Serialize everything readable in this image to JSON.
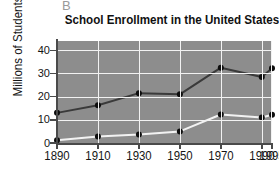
{
  "panel": {
    "letter": "B"
  },
  "title": "School Enrollment in the United States",
  "axes": {
    "ylabel": "Millions of Students",
    "xlabel": "",
    "yticks": [
      "0",
      "10",
      "20",
      "30",
      "40"
    ],
    "xticks": [
      "1890",
      "1910",
      "1930",
      "1950",
      "1970",
      "1990",
      "1995"
    ]
  },
  "colors": {
    "plot_background": "#8d8d8d",
    "gridline": "#f2f2f2",
    "axis": "#4a4a4a",
    "series_dark": "#3a3a3a",
    "series_light": "#f2f2f2",
    "marker": "#0d0d0d",
    "title_text": "#111111",
    "panel_letter": "#9a9a9a"
  },
  "chart_data": {
    "type": "line",
    "title": "School Enrollment in the United States",
    "xlabel": "",
    "ylabel": "Millions of Students",
    "x": [
      1890,
      1910,
      1930,
      1950,
      1970,
      1990,
      1995
    ],
    "categories": [
      "1890",
      "1910",
      "1930",
      "1950",
      "1970",
      "1990",
      "1995"
    ],
    "xlim": [
      1890,
      1995
    ],
    "ylim": [
      0,
      44
    ],
    "yticks": [
      0,
      10,
      20,
      30,
      40
    ],
    "grid": true,
    "legend": "none",
    "series": [
      {
        "name": "Elementary enrollment",
        "color": "#3a3a3a",
        "marker": "circle",
        "values": [
          13.0,
          16.3,
          21.5,
          21.0,
          32.5,
          28.5,
          32.2
        ]
      },
      {
        "name": "Secondary enrollment",
        "color": "#f2f2f2",
        "marker": "circle",
        "values": [
          1.2,
          2.8,
          3.7,
          5.0,
          12.3,
          11.0,
          12.2
        ]
      }
    ]
  }
}
